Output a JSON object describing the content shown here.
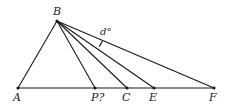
{
  "diagram": {
    "points": {
      "A": {
        "label": "A",
        "x": 18,
        "y": 88
      },
      "B": {
        "label": "B",
        "x": 57,
        "y": 21
      },
      "P": {
        "label": "P?",
        "x": 95,
        "y": 88
      },
      "C": {
        "label": "C",
        "x": 127,
        "y": 88
      },
      "E": {
        "label": "E",
        "x": 154,
        "y": 88
      },
      "F": {
        "label": "F",
        "x": 214,
        "y": 88
      }
    },
    "segments": [
      [
        "A",
        "F"
      ],
      [
        "B",
        "A"
      ],
      [
        "B",
        "P"
      ],
      [
        "B",
        "C"
      ],
      [
        "B",
        "E"
      ],
      [
        "B",
        "F"
      ]
    ],
    "angle_label": "d°",
    "angle_between": [
      "BE",
      "BF"
    ]
  }
}
